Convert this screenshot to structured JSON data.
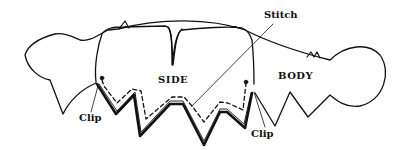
{
  "diagram": {
    "type": "sewing-pattern-illustration",
    "labels": {
      "side": "SIDE",
      "body": "BODY",
      "stitch": "Stitch",
      "clip_left": "Clip",
      "clip_right": "Clip"
    },
    "colors": {
      "ink": "#111111",
      "background": "#ffffff"
    }
  }
}
